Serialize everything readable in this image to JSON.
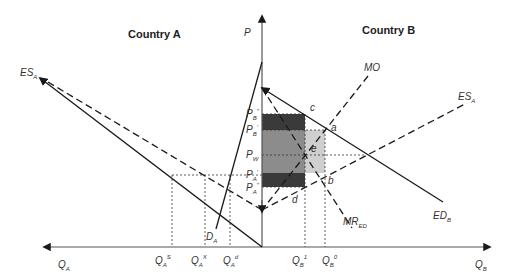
{
  "titles": {
    "country_a": "Country A",
    "country_b": "Country B"
  },
  "axes": {
    "price": "P",
    "qa": {
      "main": "Q",
      "sub": "A"
    },
    "qb": {
      "main": "Q",
      "sub": "B"
    }
  },
  "curves": {
    "es_a_left": {
      "main": "ES",
      "sub": "A"
    },
    "es_a_right": {
      "main": "ES",
      "sub": "A"
    },
    "mo": "MO",
    "ed_b": {
      "main": "ED",
      "sub": "B"
    },
    "mr_ed": {
      "main": "MR",
      "sub": "ED"
    },
    "d_a": {
      "main": "D",
      "sub": "A"
    }
  },
  "price_labels": {
    "pb2": {
      "main": "P",
      "sub": "B",
      "sup": "″"
    },
    "pb1": {
      "main": "P",
      "sub": "B",
      "sup": "′"
    },
    "pw": {
      "main": "P",
      "sub": "W"
    },
    "pa1": {
      "main": "P",
      "sub": "A",
      "sup": "′"
    },
    "pa2": {
      "main": "P",
      "sub": "A",
      "sup": "″"
    }
  },
  "quantity_labels": {
    "qa_s": {
      "main": "Q",
      "sub": "A",
      "sup": "S"
    },
    "qa_x": {
      "main": "Q",
      "sub": "A",
      "sup": "X"
    },
    "qa_d": {
      "main": "Q",
      "sub": "A",
      "sup": "d"
    },
    "qb_1": {
      "main": "Q",
      "sub": "B",
      "sup": "1"
    },
    "qb_0": {
      "main": "Q",
      "sub": "B",
      "sup": "0"
    }
  },
  "points": {
    "a": "a",
    "b": "b",
    "c": "c",
    "d": "d",
    "e": "e"
  },
  "colors": {
    "dark_fill": "#3a3a3a",
    "mid_fill": "#8c8c8c",
    "light_fill": "#cfcfcf",
    "line": "#1a1a1a",
    "axis": "#555555"
  }
}
